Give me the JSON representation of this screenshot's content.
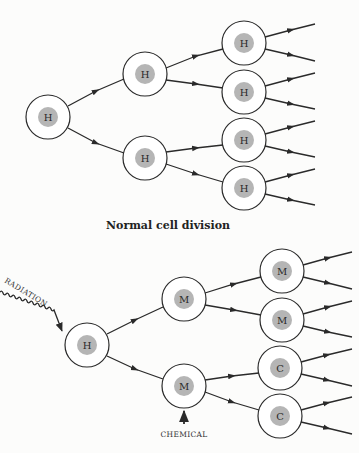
{
  "colors": {
    "line": "#2a2a2a",
    "nucleus": "#b5b5b5",
    "background": "#fcfcfb"
  },
  "top_diagram": {
    "caption": "Normal cell division",
    "cells": [
      {
        "id": "t0",
        "label": "H",
        "x": 48,
        "y": 117
      },
      {
        "id": "t1a",
        "label": "H",
        "x": 145,
        "y": 74
      },
      {
        "id": "t1b",
        "label": "H",
        "x": 145,
        "y": 158
      },
      {
        "id": "t2a",
        "label": "H",
        "x": 244,
        "y": 43
      },
      {
        "id": "t2b",
        "label": "H",
        "x": 244,
        "y": 92
      },
      {
        "id": "t2c",
        "label": "H",
        "x": 244,
        "y": 140
      },
      {
        "id": "t2d",
        "label": "H",
        "x": 244,
        "y": 188
      }
    ]
  },
  "bottom_diagram": {
    "radiation_label": "RADIATION",
    "chemical_label": "CHEMICAL",
    "cells": [
      {
        "id": "b0",
        "label": "H",
        "x": 87,
        "y": 345
      },
      {
        "id": "b1a",
        "label": "M",
        "x": 184,
        "y": 299
      },
      {
        "id": "b1b",
        "label": "M",
        "x": 184,
        "y": 386
      },
      {
        "id": "b2a",
        "label": "M",
        "x": 282,
        "y": 271
      },
      {
        "id": "b2b",
        "label": "M",
        "x": 282,
        "y": 320
      },
      {
        "id": "b2c",
        "label": "C",
        "x": 280,
        "y": 368
      },
      {
        "id": "b2d",
        "label": "C",
        "x": 280,
        "y": 416
      }
    ]
  }
}
